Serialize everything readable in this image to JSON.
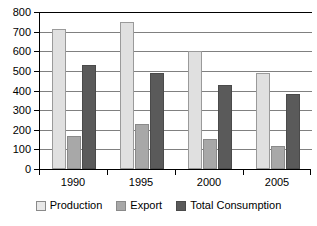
{
  "chart_data": {
    "type": "bar",
    "title": "",
    "subtitle": "",
    "xlabel": "",
    "ylabel": "",
    "categories": [
      "1990",
      "1995",
      "2000",
      "2005"
    ],
    "series": [
      {
        "name": "Production",
        "color": "#e0e0e0",
        "values": [
          715,
          750,
          600,
          490
        ]
      },
      {
        "name": "Export",
        "color": "#a8a8a8",
        "values": [
          170,
          230,
          155,
          115
        ]
      },
      {
        "name": "Total Consumption",
        "color": "#5a5a5a",
        "values": [
          530,
          490,
          430,
          380
        ]
      }
    ],
    "ylim": [
      0,
      800
    ],
    "ytick_step": 100,
    "yticks": [
      "0",
      "100",
      "200",
      "300",
      "400",
      "500",
      "600",
      "700",
      "800"
    ],
    "grid": true,
    "legend_position": "bottom"
  }
}
